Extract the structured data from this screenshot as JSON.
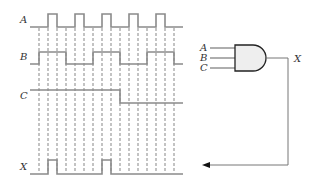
{
  "colors": {
    "waveform": "#8a8a8a",
    "dash": "#555555",
    "gate_fill": "#eeeeee",
    "gate_stroke": "#222222",
    "wire": "#777777",
    "text": "#333333"
  },
  "timing": {
    "signals": [
      {
        "name": "A",
        "label": "A",
        "low_y": 27,
        "high_y": 14,
        "label_x": 20,
        "segments": [
          [
            30,
            0
          ],
          [
            48,
            1
          ],
          [
            57,
            0
          ],
          [
            75,
            1
          ],
          [
            84,
            0
          ],
          [
            102,
            1
          ],
          [
            111,
            0
          ],
          [
            129,
            1
          ],
          [
            138,
            0
          ],
          [
            156,
            1
          ],
          [
            165,
            0
          ],
          [
            183,
            0
          ]
        ]
      },
      {
        "name": "B",
        "label": "B",
        "low_y": 64,
        "high_y": 52,
        "label_x": 20,
        "segments": [
          [
            30,
            0
          ],
          [
            39,
            1
          ],
          [
            66,
            0
          ],
          [
            93,
            1
          ],
          [
            120,
            0
          ],
          [
            147,
            1
          ],
          [
            174,
            0
          ],
          [
            183,
            0
          ]
        ]
      },
      {
        "name": "C",
        "label": "C",
        "low_y": 103,
        "high_y": 90,
        "label_x": 20,
        "segments": [
          [
            30,
            1
          ],
          [
            120,
            0
          ],
          [
            183,
            0
          ]
        ]
      },
      {
        "name": "X",
        "label": "X",
        "low_y": 174,
        "high_y": 160,
        "label_x": 20,
        "segments": [
          [
            30,
            0
          ],
          [
            48,
            1
          ],
          [
            57,
            0
          ],
          [
            102,
            1
          ],
          [
            111,
            0
          ],
          [
            183,
            0
          ]
        ]
      }
    ],
    "dashed_x": [
      39,
      48,
      57,
      66,
      75,
      84,
      93,
      102,
      111,
      120,
      129,
      138,
      147,
      156,
      165,
      174
    ],
    "dashed_top": 28,
    "dashed_bottom": 172
  },
  "gate": {
    "type": "AND",
    "inputs": [
      "A",
      "B",
      "C"
    ],
    "output": "X"
  }
}
